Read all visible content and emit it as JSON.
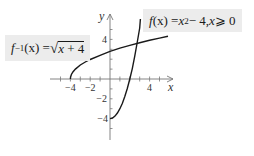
{
  "graph": {
    "x_axis_label": "x",
    "y_axis_label": "y",
    "x_tick_labels": [
      "−4",
      "−2",
      "4"
    ],
    "y_tick_labels": [
      "4",
      "−2",
      "−4"
    ],
    "colors": {
      "curve": "#1a1a1a",
      "axis": "#777777",
      "label_bg": "#ececec"
    }
  },
  "labels": {
    "f": {
      "name": "f",
      "arg": "(x) = ",
      "var": "x",
      "exp": "2",
      "rest": " − 4, ",
      "cond_var": "x",
      "cond": " ⩾ 0"
    },
    "f_inverse": {
      "name": "f",
      "exp": "−1",
      "arg": "(x) = ",
      "radical": "√",
      "radicand_var": "x",
      "radicand_rest": " + 4"
    }
  },
  "curves": [
    {
      "id": "f",
      "expression": "f(x) = x^2 - 4, x >= 0",
      "domain": [
        0,
        3.1
      ]
    },
    {
      "id": "f_inverse",
      "expression": "f^-1(x) = sqrt(x + 4)",
      "domain": [
        -4,
        6
      ]
    }
  ]
}
